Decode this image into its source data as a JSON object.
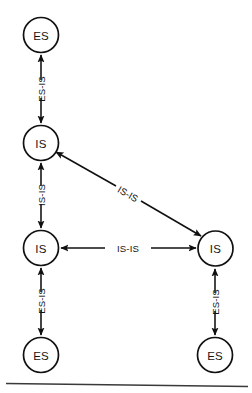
{
  "diagram": {
    "type": "network-topology",
    "background_color": "#ffffff",
    "stroke_color": "#101010",
    "nodes": [
      {
        "id": "es-top-left",
        "label": "ES",
        "cx": 41,
        "cy": 35,
        "r": 17.5
      },
      {
        "id": "is-upper-left",
        "label": "IS",
        "cx": 41,
        "cy": 143,
        "r": 17.5
      },
      {
        "id": "is-mid-left",
        "label": "IS",
        "cx": 41,
        "cy": 248,
        "r": 17.5
      },
      {
        "id": "is-right",
        "label": "IS",
        "cx": 215.5,
        "cy": 248.5,
        "r": 17.5
      },
      {
        "id": "es-bottom-left",
        "label": "ES",
        "cx": 41,
        "cy": 355,
        "r": 17.5
      },
      {
        "id": "es-bottom-right",
        "label": "ES",
        "cx": 215,
        "cy": 355,
        "r": 17.5
      }
    ],
    "edges": [
      {
        "id": "edge-es-top-left-to-is-upper-left",
        "label": "ES-IS",
        "from": "es-top-left",
        "to": "is-upper-left",
        "orientation": "vertical",
        "bidirectional": true,
        "x1": 41,
        "y1": 55,
        "x2": 41,
        "y2": 123,
        "label_x": 41,
        "label_y": 89,
        "label_rotation": -90
      },
      {
        "id": "edge-is-upper-left-to-is-mid-left",
        "label": "IS-IS",
        "from": "is-upper-left",
        "to": "is-mid-left",
        "orientation": "vertical",
        "bidirectional": true,
        "x1": 41,
        "y1": 163,
        "x2": 41,
        "y2": 228,
        "label_x": 41,
        "label_y": 195,
        "label_rotation": -90
      },
      {
        "id": "edge-is-upper-left-to-is-right",
        "label": "IS-IS",
        "from": "is-upper-left",
        "to": "is-right",
        "orientation": "diagonal",
        "bidirectional": true,
        "x1": 56,
        "y1": 152,
        "x2": 201,
        "y2": 236,
        "label_x": 128,
        "label_y": 194,
        "label_rotation": 30
      },
      {
        "id": "edge-is-mid-left-to-is-right",
        "label": "IS-IS",
        "from": "is-mid-left",
        "to": "is-right",
        "orientation": "horizontal",
        "bidirectional": true,
        "x1": 61,
        "y1": 248,
        "x2": 196,
        "y2": 248,
        "label_x": 128,
        "label_y": 248,
        "label_rotation": 0
      },
      {
        "id": "edge-es-bottom-left-to-is-mid-left",
        "label": "ES-IS",
        "from": "es-bottom-left",
        "to": "is-mid-left",
        "orientation": "vertical",
        "bidirectional": true,
        "x1": 41,
        "y1": 268,
        "x2": 41,
        "y2": 335,
        "label_x": 41,
        "label_y": 301,
        "label_rotation": -90
      },
      {
        "id": "edge-es-bottom-right-to-is-right",
        "label": "ES-IS",
        "from": "es-bottom-right",
        "to": "is-right",
        "orientation": "vertical",
        "bidirectional": true,
        "x1": 215,
        "y1": 269,
        "x2": 215,
        "y2": 335,
        "label_x": 215,
        "label_y": 302,
        "label_rotation": -90
      }
    ],
    "footer_rule": {
      "x1": 6,
      "y1": 383.5,
      "x2": 248,
      "y2": 386.5
    }
  }
}
